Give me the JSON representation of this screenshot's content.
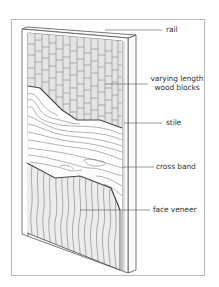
{
  "diagram": {
    "labels": {
      "rail": "rail",
      "wood_blocks_line1": "varying length",
      "wood_blocks_line2": "wood blocks",
      "stile": "stile",
      "cross_band": "cross band",
      "face_veneer": "face veneer"
    },
    "colors": {
      "line": "#555555",
      "block_fill": "#e4e4e4",
      "veneer_fill": "#ececec",
      "frame": "#b8b8b8"
    }
  }
}
